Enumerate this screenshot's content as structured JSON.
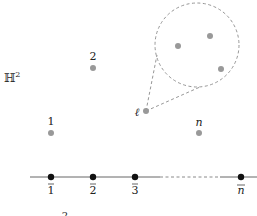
{
  "space_label": "ℍ²",
  "space_main": "ℍ",
  "space_sup": "2",
  "colors": {
    "gray_point": "#999999",
    "black_point": "#111111",
    "line": "#666666",
    "dashed": "#8a8a8a"
  },
  "upper_points": [
    {
      "label": "2",
      "x": 93,
      "y": 68
    },
    {
      "label": "1",
      "x": 51,
      "y": 133
    },
    {
      "label": "n",
      "x": 199,
      "y": 133
    }
  ],
  "ell_point": {
    "label": "ℓ",
    "x": 146,
    "y": 111
  },
  "zoom_circle": {
    "cx": 197,
    "cy": 45,
    "r": 42,
    "points": [
      {
        "x": 178,
        "y": 46
      },
      {
        "x": 210,
        "y": 36
      },
      {
        "x": 221,
        "y": 69
      }
    ]
  },
  "boundary_points": [
    {
      "label": "1",
      "x": 51
    },
    {
      "label": "2",
      "x": 93
    },
    {
      "label": "3",
      "x": 135
    },
    {
      "label": "n",
      "x": 241
    }
  ],
  "boundary_line_y": 177,
  "footer_fragment": "2"
}
